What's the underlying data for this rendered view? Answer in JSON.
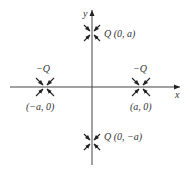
{
  "diagram": {
    "axes": {
      "x_label": "x",
      "y_label": "y",
      "origin": [
        92,
        87
      ]
    },
    "charges": [
      {
        "id": "top",
        "charge": "Q",
        "label": "Q (0, a)",
        "position": [
          92,
          33
        ],
        "field_direction": "inward-diagonal"
      },
      {
        "id": "bottom",
        "charge": "Q",
        "label": "Q (0, −a)",
        "position": [
          92,
          142
        ],
        "field_direction": "inward-diagonal"
      },
      {
        "id": "left",
        "charge": "−Q",
        "coord_label": "(−a, 0)",
        "position": [
          45,
          87
        ],
        "field_direction": "inward-diagonal"
      },
      {
        "id": "right",
        "charge": "−Q",
        "coord_label": "(a, 0)",
        "position": [
          141,
          87
        ],
        "field_direction": "inward-diagonal"
      }
    ],
    "colors": {
      "ink": "#222222",
      "background": "#ffffff"
    }
  }
}
